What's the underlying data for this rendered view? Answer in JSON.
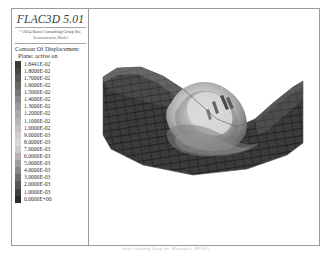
{
  "brand": {
    "title": "FLAC3D 5.01",
    "copyright": "©2014 Itasca Consulting Group Inc.",
    "model_label": "Demonstration Model"
  },
  "legend": {
    "title": "Contour Of Displacement",
    "subtitle": "Plane: active on",
    "entries": [
      {
        "value": "1.8441E-02",
        "color": "#3a3a3a"
      },
      {
        "value": "1.8000E-02",
        "color": "#474747"
      },
      {
        "value": "1.7000E-02",
        "color": "#565656"
      },
      {
        "value": "1.6000E-02",
        "color": "#666666"
      },
      {
        "value": "1.5000E-02",
        "color": "#777777"
      },
      {
        "value": "1.4000E-02",
        "color": "#888888"
      },
      {
        "value": "1.3000E-02",
        "color": "#999999"
      },
      {
        "value": "1.2000E-02",
        "color": "#a8a8a8"
      },
      {
        "value": "1.1000E-02",
        "color": "#b6b6b6"
      },
      {
        "value": "1.0000E-02",
        "color": "#c3c3c3"
      },
      {
        "value": "9.0000E-03",
        "color": "#cfcfcf"
      },
      {
        "value": "8.0000E-03",
        "color": "#d9d9d9"
      },
      {
        "value": "7.0000E-03",
        "color": "#cacaca"
      },
      {
        "value": "6.0000E-03",
        "color": "#b4b4b4"
      },
      {
        "value": "5.0000E-03",
        "color": "#9d9d9d"
      },
      {
        "value": "4.0000E-03",
        "color": "#868686"
      },
      {
        "value": "3.0000E-03",
        "color": "#6d6d6d"
      },
      {
        "value": "2.0000E-03",
        "color": "#555555"
      },
      {
        "value": "1.0000E-03",
        "color": "#3f3f3f"
      },
      {
        "value": "0.0000E+00",
        "color": "#2b2b2b"
      }
    ]
  },
  "view": {
    "model_name": "displacement-contour-slope-model"
  },
  "footer": {
    "caption": "Itasca Consulting Group, Inc. Minneapolis, MN USA"
  },
  "colors": {
    "frame": "#9a9a9a",
    "background": "#ffffff",
    "text": "#2d2d2d"
  }
}
